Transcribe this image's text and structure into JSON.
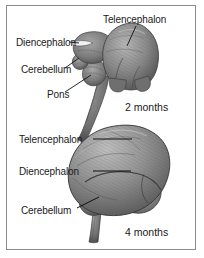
{
  "figure": {
    "style": "grayscale anatomical illustration with leader-line labels inside a thin rectangular border",
    "border_color": "#8b8b8b",
    "background_color": "#ffffff",
    "text_color": "#1a1a1a"
  },
  "panels": [
    {
      "name": "two-months-panel",
      "caption": "2 months",
      "subject": "embryonic brain, lateral view with spinal cord",
      "labels": [
        {
          "id": "telencephalon",
          "text": "Telencephalon",
          "leader": "down-left"
        },
        {
          "id": "diencephalon",
          "text": "Diencephalon",
          "leader": "right"
        },
        {
          "id": "cerebellum",
          "text": "Cerebellum",
          "leader": "up-right"
        },
        {
          "id": "pons",
          "text": "Pons",
          "leader": "up-right"
        }
      ]
    },
    {
      "name": "four-months-panel",
      "caption": "4 months",
      "subject": "fetal brain, lateral view with brainstem",
      "labels": [
        {
          "id": "telencephalon",
          "text": "Telencephalon",
          "leader": "right"
        },
        {
          "id": "diencephalon",
          "text": "Diencephalon",
          "leader": "right"
        },
        {
          "id": "cerebellum",
          "text": "Cerebellum",
          "leader": "up-right"
        }
      ]
    }
  ],
  "colors": {
    "brain_mid": "#8d8d8d",
    "brain_dark": "#5a5a5a",
    "brain_light": "#b6b6b6",
    "leader_line": "#111111"
  }
}
